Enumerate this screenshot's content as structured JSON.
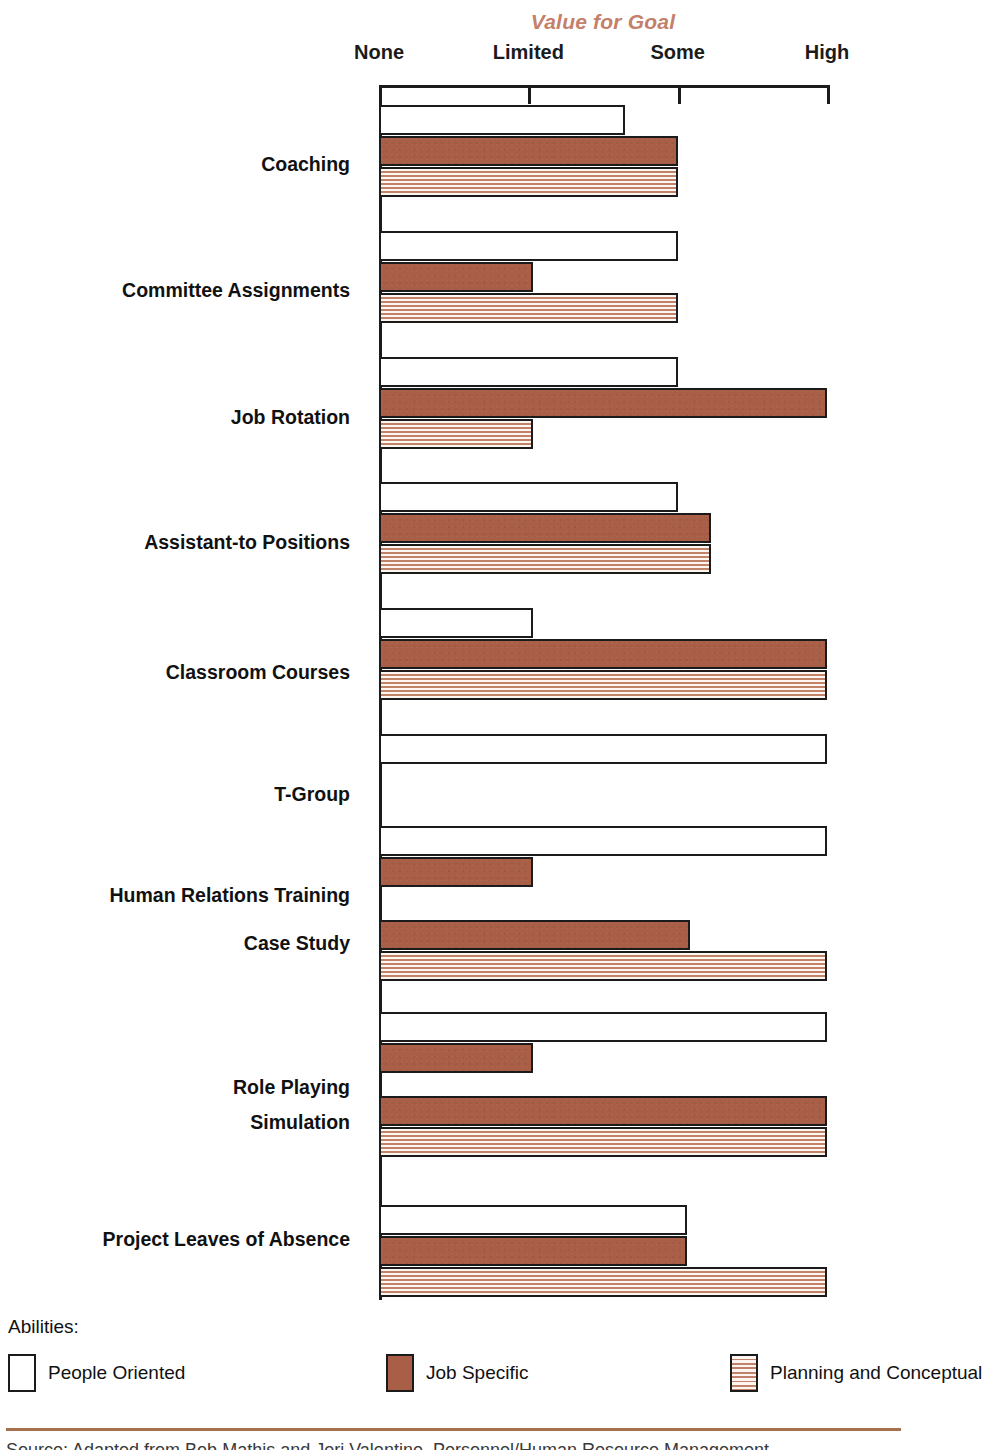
{
  "chart_data": {
    "type": "bar",
    "orientation": "horizontal",
    "title": "Value for Goal",
    "xlabel": "",
    "ylabel": "",
    "grid": false,
    "legend_position": "bottom",
    "legend_title": "Abilities:",
    "x_tick_labels": [
      "None",
      "Limited",
      "Some",
      "High"
    ],
    "x_tick_values": [
      0,
      1,
      2,
      3
    ],
    "xlim": [
      0,
      3
    ],
    "categories": [
      "Coaching",
      "Committee Assignments",
      "Job Rotation",
      "Assistant-to Positions",
      "Classroom Courses",
      "T-Group",
      "Human Relations Training",
      "Case Study",
      "Role Playing",
      "Simulation",
      "Project Leaves of Absence"
    ],
    "series": [
      {
        "name": "People Oriented",
        "key": "people",
        "swatch": "white-outlined",
        "values": [
          1.65,
          2.0,
          2.0,
          2.0,
          1.03,
          3.0,
          3.0,
          0,
          3.0,
          0,
          2.06
        ]
      },
      {
        "name": "Job Specific",
        "key": "job",
        "swatch": "solid-brown",
        "values": [
          2.0,
          1.03,
          3.0,
          2.22,
          3.0,
          0,
          1.03,
          2.08,
          1.03,
          3.0,
          2.06
        ]
      },
      {
        "name": "Planning and Conceptual",
        "key": "planning",
        "swatch": "horizontal-stripes",
        "values": [
          2.0,
          2.0,
          1.03,
          2.22,
          3.0,
          0,
          0,
          3.0,
          0,
          3.0,
          3.0
        ]
      }
    ]
  },
  "colors": {
    "title_accent": "#C4806A",
    "job_specific_fill": "#A85E47",
    "stripe_line": "#C08268",
    "rule": "#A7714F",
    "outline": "#1B1B1B"
  },
  "legend": {
    "title": "Abilities:",
    "items": [
      {
        "label": "People Oriented"
      },
      {
        "label": "Job Specific"
      },
      {
        "label": "Planning and Conceptual"
      }
    ]
  },
  "footer": {
    "source_note": "Source: Adapted from Bob Mathis and Jeri Valentine, Personnel/Human Resource Management"
  }
}
